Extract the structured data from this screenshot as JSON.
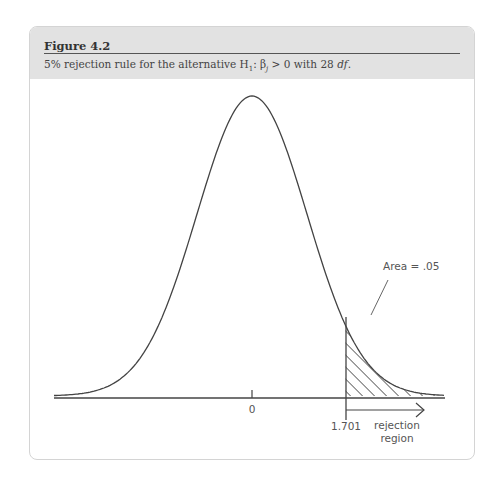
{
  "figure": {
    "label": "Figure 4.2",
    "caption_prefix": "5% rejection rule for the alternative H",
    "caption_sub": "1",
    "caption_mid": ": β",
    "caption_sub2": "j",
    "caption_rest": " > 0 with 28 ",
    "caption_df": "df",
    "caption_end": "."
  },
  "chart_data": {
    "type": "area",
    "title": "Figure 4.2",
    "subtitle": "5% rejection rule for the alternative H1: βj > 0 with 28 df.",
    "distribution": "t",
    "degrees_of_freedom": 28,
    "x_ticks": [
      {
        "value": 0,
        "label": "0"
      },
      {
        "value": 1.701,
        "label": "1.701"
      }
    ],
    "critical_value": 1.701,
    "shaded_region": {
      "from": 1.701,
      "to": "inf",
      "pattern": "diagonal-hatch"
    },
    "annotations": [
      "Area = .05",
      "rejection region"
    ],
    "xlim": [
      -4,
      3.6
    ],
    "grid": false
  },
  "labels": {
    "zero": "0",
    "critical": "1.701",
    "area": "Area = .05",
    "region_line1": "rejection",
    "region_line2": "region"
  }
}
